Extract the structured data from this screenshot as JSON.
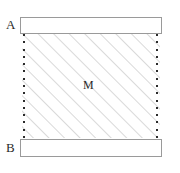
{
  "diagram": {
    "background_color": "#ffffff",
    "labels": {
      "top_plate": "A",
      "bottom_plate": "B",
      "middle_region": "M"
    },
    "plates": [
      {
        "name": "top-plate",
        "label": "A",
        "fill": "#ffffff",
        "stroke": "#9a9a9a"
      },
      {
        "name": "bottom-plate",
        "label": "B",
        "fill": "#ffffff",
        "stroke": "#9a9a9a"
      }
    ],
    "middle_region": {
      "name": "membrane",
      "label": "M",
      "fill": "#ffffff",
      "hatch_color": "#b4b4b4",
      "hatch_direction": "forward-slash-45",
      "hatch_spacing_px": 11,
      "hatch_line_count": 23
    },
    "edges": {
      "dot_color": "#2b2b2b",
      "dot_count": 15,
      "left_edge_name": "left-dotted-boundary",
      "right_edge_name": "right-dotted-boundary"
    }
  }
}
